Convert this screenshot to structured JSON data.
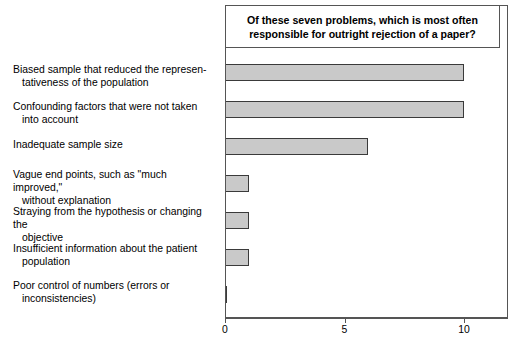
{
  "chart_data": {
    "type": "bar",
    "orientation": "horizontal",
    "title": "Of these seven problems, which is most often responsible for outright rejection of a paper?",
    "title_lines": [
      "Of these seven problems, which is most often",
      "responsible for outright rejection of a paper?"
    ],
    "categories": [
      "Biased sample that reduced the representativeness of the population",
      "Confounding factors that were not taken into account",
      "Inadequate sample size",
      "Vague end points, such as \"much improved,\" without explanation",
      "Straying from the hypothesis or changing the objective",
      "Insufficient information about the patient population",
      "Poor control of numbers (errors or inconsistencies)"
    ],
    "category_lines": [
      [
        "Biased sample that reduced the represen-",
        "tativeness of the population"
      ],
      [
        "Confounding factors that were not taken",
        "into account"
      ],
      [
        "Inadequate sample size",
        ""
      ],
      [
        "Vague end points, such as \"much improved,\"",
        "without explanation"
      ],
      [
        "Straying from the hypothesis or changing the",
        "objective"
      ],
      [
        "Insufficient information about the patient",
        "population"
      ],
      [
        "Poor control of numbers (errors or",
        "inconsistencies)"
      ]
    ],
    "values": [
      10,
      10,
      6,
      1,
      1,
      1,
      0
    ],
    "xlabel": "",
    "ylabel": "",
    "xlim": [
      0,
      11.8
    ],
    "xticks": [
      0,
      5,
      10
    ],
    "xtick_labels": [
      "0",
      "5",
      "10"
    ],
    "grid": false,
    "legend": null,
    "bar_fill_color": "#c9c9c9",
    "bar_edge_color": "#3a3a3a",
    "frame_color": "#555555",
    "background_color": "#ffffff"
  }
}
